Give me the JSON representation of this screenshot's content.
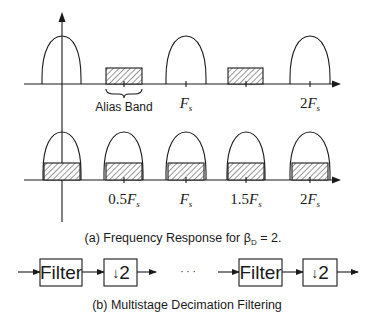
{
  "figure": {
    "top_row": {
      "alias_band_label": "Alias Band",
      "tick_labels": [
        {
          "pre": "",
          "var": "F",
          "sub": "s"
        },
        {
          "pre": "2",
          "var": "F",
          "sub": "s"
        }
      ]
    },
    "bottom_row": {
      "tick_labels": [
        {
          "pre": "0.5",
          "var": "F",
          "sub": "s"
        },
        {
          "pre": "",
          "var": "F",
          "sub": "s"
        },
        {
          "pre": "1.5",
          "var": "F",
          "sub": "s"
        },
        {
          "pre": "2",
          "var": "F",
          "sub": "s"
        }
      ]
    },
    "caption_a": {
      "text": "(a) Frequency Response for ",
      "beta": "β",
      "beta_sub": "D",
      "suffix": " = 2."
    },
    "block_diagram": {
      "filter_label": "Filter",
      "downsample_arrow": "↓",
      "downsample_factor": "2",
      "ellipsis": "· · ·"
    },
    "caption_b": "(b) Multistage Decimation Filtering"
  }
}
